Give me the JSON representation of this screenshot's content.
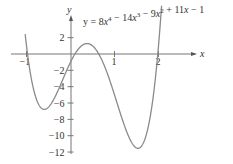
{
  "chart_data": {
    "type": "line",
    "equation": {
      "coefficients": [
        8,
        -14,
        -9,
        11,
        -1
      ],
      "text": "y = 8x⁴ − 14x³ − 9x² + 11x − 1"
    },
    "xlabel": "x",
    "ylabel": "y",
    "x_ticks": [
      -1,
      1,
      2
    ],
    "y_ticks": [
      2,
      -2,
      -4,
      -6,
      -8,
      -10,
      -12
    ],
    "x_tick_labels": [
      "−1",
      "1",
      "2"
    ],
    "y_tick_labels": [
      "2",
      "−2",
      "−4",
      "−6",
      "−8",
      "−10",
      "−12"
    ],
    "xlim": [
      -1.05,
      2.1
    ],
    "ylim": [
      -13,
      3
    ],
    "grid": false,
    "series": [
      {
        "name": "y = 8x⁴ − 14x³ − 9x² + 11x − 1",
        "x": [
          -1.0,
          -0.6,
          -0.5,
          0.0,
          0.3,
          0.5,
          1.0,
          1.4,
          1.5,
          2.0
        ],
        "y": [
          1.0,
          -6.5,
          -6.5,
          -1.0,
          1.7,
          0.75,
          -5.0,
          -11.4,
          -11.5,
          1.0
        ]
      }
    ],
    "color": "#8a8a8a"
  }
}
